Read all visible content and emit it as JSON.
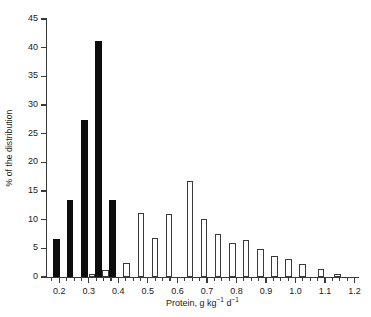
{
  "chart_data": {
    "type": "bar",
    "title": "",
    "subtitle": "",
    "xlabel": "Protein, g kg⁻¹ d⁻¹",
    "xlabel_parts": {
      "prefix": "Protein, g kg",
      "sup1": "−1",
      "middle": " d",
      "sup2": "−1"
    },
    "ylabel": "% of the distribution",
    "xlim": [
      0.155,
      1.215
    ],
    "ylim": [
      0,
      45
    ],
    "xticks": [
      0.2,
      0.3,
      0.4,
      0.5,
      0.6,
      0.7,
      0.8,
      0.9,
      1.0,
      1.1,
      1.2
    ],
    "xticklabels": [
      "0.2",
      "0.3",
      "0.4",
      "0.5",
      "0.6",
      "0.7",
      "0.8",
      "0.9",
      "1.0",
      "1.1",
      "1.2"
    ],
    "xminorticks": [
      0.175,
      0.225,
      0.25,
      0.275,
      0.325,
      0.35,
      0.375,
      0.425,
      0.45,
      0.475,
      0.525,
      0.55,
      0.575,
      0.625,
      0.65,
      0.675,
      0.725,
      0.75,
      0.775,
      0.825,
      0.85,
      0.875,
      0.925,
      0.95,
      0.975,
      1.025,
      1.05,
      1.075,
      1.125,
      1.15,
      1.175
    ],
    "yticks": [
      0,
      5,
      10,
      15,
      20,
      25,
      30,
      35,
      40,
      45
    ],
    "yticklabels": [
      "0",
      "5",
      "10",
      "15",
      "20",
      "25",
      "30",
      "35",
      "40",
      "45"
    ],
    "grid": false,
    "legend": null,
    "bar_width": 0.022,
    "series": [
      {
        "name": "Low protein intake group",
        "style": "filled",
        "color": "#0d0d0d",
        "bars": [
          {
            "x": 0.19,
            "value": 6.7
          },
          {
            "x": 0.237,
            "value": 13.5
          },
          {
            "x": 0.285,
            "value": 27.3
          },
          {
            "x": 0.333,
            "value": 41.2
          },
          {
            "x": 0.38,
            "value": 13.5
          }
        ]
      },
      {
        "name": "Habitual protein intake distribution",
        "style": "open",
        "color": "#ffffff",
        "edge_color": "#3a3a3a",
        "bars": [
          {
            "x": 0.31,
            "value": 0.5
          },
          {
            "x": 0.357,
            "value": 1.2
          },
          {
            "x": 0.428,
            "value": 2.4
          },
          {
            "x": 0.476,
            "value": 11.1
          },
          {
            "x": 0.524,
            "value": 6.8
          },
          {
            "x": 0.571,
            "value": 11.0
          },
          {
            "x": 0.643,
            "value": 16.8
          },
          {
            "x": 0.69,
            "value": 10.2
          },
          {
            "x": 0.738,
            "value": 7.5
          },
          {
            "x": 0.786,
            "value": 6.0
          },
          {
            "x": 0.833,
            "value": 6.5
          },
          {
            "x": 0.881,
            "value": 4.9
          },
          {
            "x": 0.929,
            "value": 3.7
          },
          {
            "x": 0.976,
            "value": 3.1
          },
          {
            "x": 1.024,
            "value": 2.3
          },
          {
            "x": 1.086,
            "value": 1.4
          },
          {
            "x": 1.143,
            "value": 0.6
          }
        ]
      }
    ]
  }
}
